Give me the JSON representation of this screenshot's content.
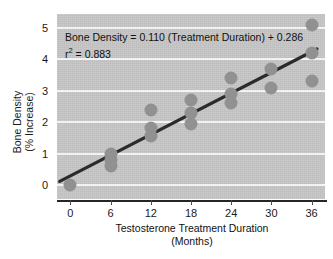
{
  "chart_data": {
    "type": "scatter",
    "title": "",
    "xlabel": "Testosterone Treatment Duration",
    "xlabel_line2": "(Months)",
    "ylabel": "Bone Density",
    "ylabel_line2": "(% Increase)",
    "xlim": [
      -2,
      38
    ],
    "ylim": [
      -0.45,
      5.45
    ],
    "xticks": [
      0,
      6,
      12,
      18,
      24,
      30,
      36
    ],
    "xtick_labels": [
      "0",
      "6",
      "12",
      "18",
      "24",
      "30",
      "36"
    ],
    "yticks": [
      0,
      1,
      2,
      3,
      4,
      5
    ],
    "ytick_labels": [
      "0",
      "1",
      "2",
      "3",
      "4",
      "5"
    ],
    "grid": "horizontal-white",
    "legend": "none",
    "points": [
      {
        "x": 0,
        "y": 0.0
      },
      {
        "x": 6,
        "y": 1.0
      },
      {
        "x": 6,
        "y": 0.8
      },
      {
        "x": 6,
        "y": 0.6
      },
      {
        "x": 12,
        "y": 2.4
      },
      {
        "x": 12,
        "y": 1.8
      },
      {
        "x": 12,
        "y": 1.55
      },
      {
        "x": 18,
        "y": 2.7
      },
      {
        "x": 18,
        "y": 2.3
      },
      {
        "x": 18,
        "y": 1.95
      },
      {
        "x": 24,
        "y": 3.4
      },
      {
        "x": 24,
        "y": 2.9
      },
      {
        "x": 24,
        "y": 2.6
      },
      {
        "x": 30,
        "y": 3.7
      },
      {
        "x": 30,
        "y": 3.1
      },
      {
        "x": 36,
        "y": 5.1
      },
      {
        "x": 36,
        "y": 4.2
      },
      {
        "x": 36,
        "y": 3.3
      }
    ],
    "point_color": "#919191",
    "trendline": {
      "slope": 0.11,
      "intercept": 0.286,
      "x_start": -1.6,
      "x_end": 36.8,
      "color": "#2b2b2b"
    },
    "annotations": {
      "equation": "Bone Density = 0.110 (Treatment Duration) + 0.286",
      "r_squared_label": "r",
      "r_squared_exponent": "2",
      "r_squared_value": " = 0.883"
    },
    "plot_background": "#c6c6c6",
    "gridline_color": "#f2f2f2",
    "axis_color": "#262626"
  }
}
